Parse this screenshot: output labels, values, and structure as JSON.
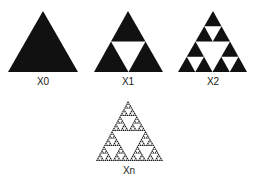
{
  "diagram": {
    "fill_color": "#111111",
    "background_color": "#ffffff",
    "panels": [
      {
        "label": "X0",
        "iteration": 0,
        "apex": [
          43,
          11
        ],
        "base_left": [
          8,
          72
        ],
        "base_right": [
          78,
          72
        ]
      },
      {
        "label": "X1",
        "iteration": 1,
        "apex": [
          128,
          11
        ],
        "base_left": [
          94,
          72
        ],
        "base_right": [
          163,
          72
        ]
      },
      {
        "label": "X2",
        "iteration": 2,
        "apex": [
          213,
          11
        ],
        "base_left": [
          178,
          72
        ],
        "base_right": [
          247,
          72
        ]
      },
      {
        "label": "Xn",
        "iteration": 5,
        "apex": [
          128,
          101
        ],
        "base_left": [
          96,
          161
        ],
        "base_right": [
          163,
          161
        ]
      }
    ]
  }
}
